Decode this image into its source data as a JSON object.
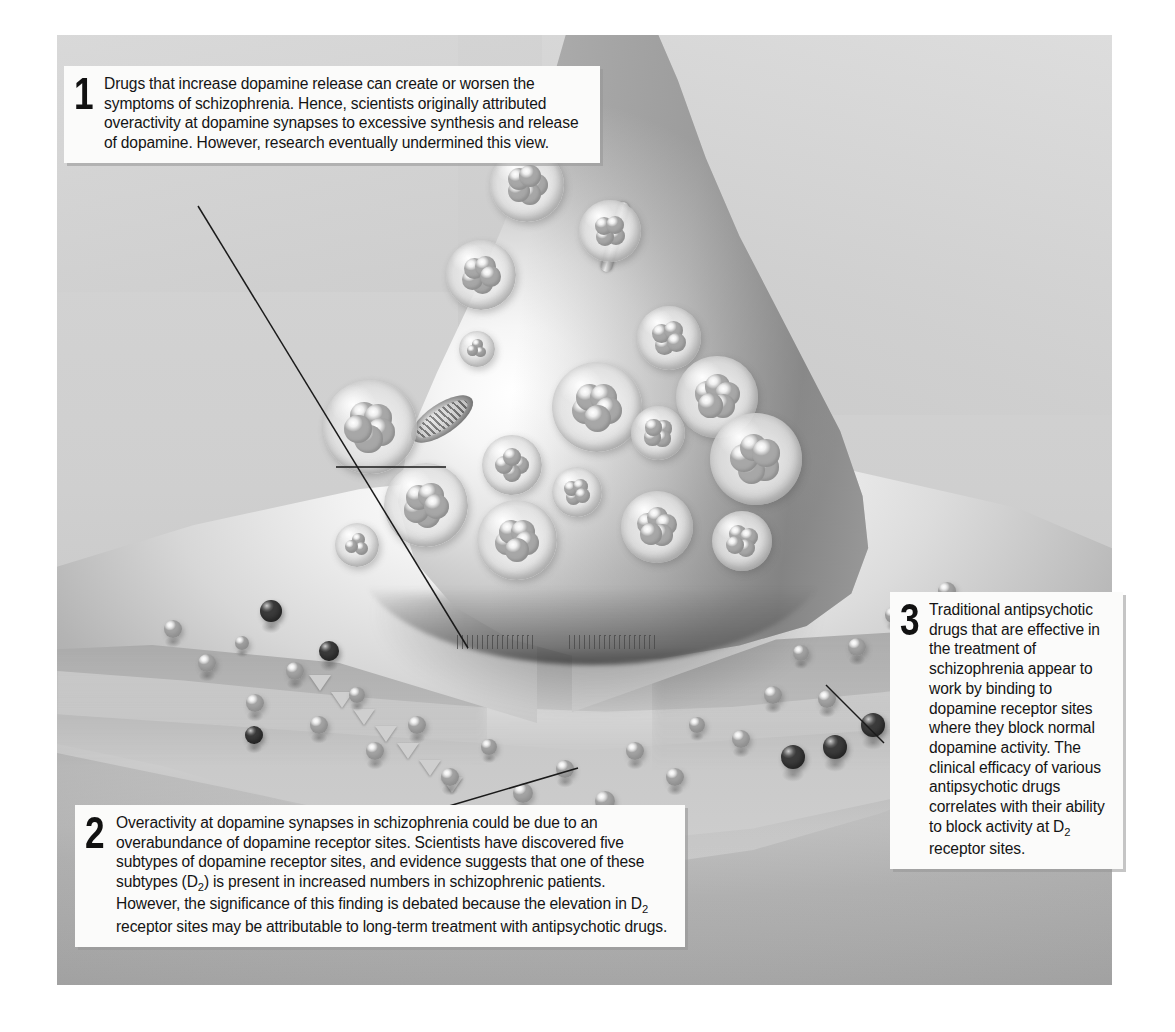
{
  "figure": {
    "background_color": "#d9d9d9",
    "plate_border_color": "#bdbdbd"
  },
  "callouts": [
    {
      "number": "1",
      "text": "Drugs that increase dopamine release can create or worsen the symptoms of schizophrenia. Hence, scientists originally attributed overactivity at dopamine synapses to excessive synthesis and release of dopamine. However, research eventually undermined this view.",
      "position": "top-left",
      "points_to": [
        "synaptic-vesicle",
        "vesicle-release-site"
      ]
    },
    {
      "number": "2",
      "text_parts": [
        "Overactivity at dopamine synapses in schizophrenia could be due to an overabundance of dopamine receptor sites. Scientists have discovered five subtypes of dopamine receptor sites, and evidence suggests that one of these subtypes (D",
        "2",
        ") is present in increased numbers in schizophrenic patients. However, the significance of this finding is debated because the elevation in D",
        "2",
        " receptor sites may be attributable to long-term treatment with antipsychotic drugs."
      ],
      "position": "bottom-left",
      "points_to": [
        "dopamine-molecule-at-receptor"
      ]
    },
    {
      "number": "3",
      "text_parts": [
        "Traditional antipsychotic drugs that are effective in the treatment of schizophrenia appear to work by binding to dopamine receptor sites where they block normal dopamine activity. The clinical efficacy of various antipsychotic drugs correlates with their ability to block activity at D",
        "2",
        " receptor sites."
      ],
      "position": "right",
      "points_to": [
        "antipsychotic-drug-molecule"
      ]
    }
  ],
  "illustration": {
    "structures": [
      {
        "name": "axon-terminal",
        "label": "presynaptic axon terminal (bouton)"
      },
      {
        "name": "synaptic-vesicle",
        "label": "synaptic vesicle containing dopamine"
      },
      {
        "name": "mitochondrion",
        "label": "mitochondrion"
      },
      {
        "name": "microtubule",
        "label": "microtubule filament"
      },
      {
        "name": "synaptic-cleft",
        "label": "synaptic cleft"
      },
      {
        "name": "postsynaptic-membrane",
        "label": "postsynaptic membrane"
      },
      {
        "name": "receptor-site",
        "label": "dopamine receptor site"
      },
      {
        "name": "dopamine-molecule",
        "label": "dopamine molecule (light sphere)"
      },
      {
        "name": "antipsychotic-drug-molecule",
        "label": "antipsychotic drug molecule (dark sphere)"
      }
    ],
    "vesicles": [
      {
        "x": 470,
        "y": 150,
        "r": 37
      },
      {
        "x": 553,
        "y": 196,
        "r": 31
      },
      {
        "x": 424,
        "y": 240,
        "r": 35
      },
      {
        "x": 612,
        "y": 303,
        "r": 32
      },
      {
        "x": 540,
        "y": 372,
        "r": 45
      },
      {
        "x": 660,
        "y": 362,
        "r": 41
      },
      {
        "x": 313,
        "y": 392,
        "r": 47
      },
      {
        "x": 420,
        "y": 314,
        "r": 18
      },
      {
        "x": 601,
        "y": 398,
        "r": 27
      },
      {
        "x": 455,
        "y": 430,
        "r": 30
      },
      {
        "x": 699,
        "y": 424,
        "r": 46
      },
      {
        "x": 369,
        "y": 470,
        "r": 42
      },
      {
        "x": 520,
        "y": 457,
        "r": 25
      },
      {
        "x": 460,
        "y": 505,
        "r": 40
      },
      {
        "x": 600,
        "y": 492,
        "r": 36
      },
      {
        "x": 685,
        "y": 506,
        "r": 30
      },
      {
        "x": 300,
        "y": 510,
        "r": 22
      }
    ],
    "dopamine_dots": [
      {
        "x": 116,
        "y": 594,
        "r": 9
      },
      {
        "x": 150,
        "y": 628,
        "r": 9
      },
      {
        "x": 185,
        "y": 608,
        "r": 7
      },
      {
        "x": 198,
        "y": 668,
        "r": 9
      },
      {
        "x": 238,
        "y": 636,
        "r": 9
      },
      {
        "x": 262,
        "y": 690,
        "r": 9
      },
      {
        "x": 300,
        "y": 660,
        "r": 8
      },
      {
        "x": 318,
        "y": 716,
        "r": 9
      },
      {
        "x": 360,
        "y": 690,
        "r": 9
      },
      {
        "x": 393,
        "y": 742,
        "r": 9
      },
      {
        "x": 432,
        "y": 712,
        "r": 8
      },
      {
        "x": 466,
        "y": 758,
        "r": 10
      },
      {
        "x": 508,
        "y": 734,
        "r": 9
      },
      {
        "x": 548,
        "y": 766,
        "r": 10
      },
      {
        "x": 578,
        "y": 716,
        "r": 9
      },
      {
        "x": 618,
        "y": 742,
        "r": 9
      },
      {
        "x": 640,
        "y": 690,
        "r": 8
      },
      {
        "x": 684,
        "y": 704,
        "r": 9
      },
      {
        "x": 716,
        "y": 660,
        "r": 9
      },
      {
        "x": 744,
        "y": 618,
        "r": 8
      },
      {
        "x": 770,
        "y": 664,
        "r": 9
      },
      {
        "x": 800,
        "y": 612,
        "r": 9
      },
      {
        "x": 836,
        "y": 580,
        "r": 8
      },
      {
        "x": 858,
        "y": 630,
        "r": 9
      },
      {
        "x": 890,
        "y": 556,
        "r": 9
      },
      {
        "x": 921,
        "y": 596,
        "r": 8
      }
    ],
    "drug_dots": [
      {
        "x": 214,
        "y": 576,
        "r": 11
      },
      {
        "x": 272,
        "y": 616,
        "r": 10
      },
      {
        "x": 197,
        "y": 700,
        "r": 9
      },
      {
        "x": 736,
        "y": 722,
        "r": 12
      },
      {
        "x": 778,
        "y": 712,
        "r": 12
      },
      {
        "x": 816,
        "y": 690,
        "r": 12
      },
      {
        "x": 853,
        "y": 662,
        "r": 12
      },
      {
        "x": 884,
        "y": 634,
        "r": 11
      }
    ]
  }
}
